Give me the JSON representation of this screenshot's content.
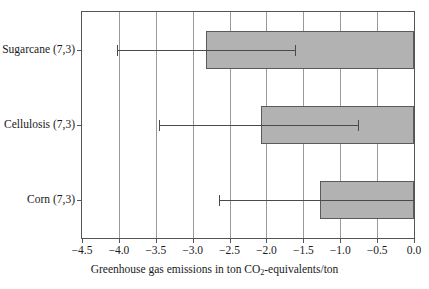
{
  "chart_data": {
    "type": "bar",
    "orientation": "horizontal",
    "title": "",
    "xlabel": "Greenhouse gas emissions in ton CO2-equivalents/ton",
    "xlabel_parts": {
      "before": "Greenhouse gas emissions in ton CO",
      "sub": "2",
      "after": "-equivalents/ton"
    },
    "ylabel": "",
    "categories": [
      "Sugarcane (7,3)",
      "Cellulosis (7,3)",
      "Corn (7,3)"
    ],
    "values": [
      -2.82,
      -2.08,
      -1.27
    ],
    "error_low": [
      -4.02,
      -3.45,
      -2.64
    ],
    "error_high": [
      -1.61,
      -0.76,
      0.0
    ],
    "xlim": [
      -4.5,
      0.0
    ],
    "xticks": [
      -4.5,
      -4.0,
      -3.5,
      -3.0,
      -2.5,
      -2.0,
      -1.5,
      -1.0,
      -0.5,
      0.0
    ],
    "xticklabels": [
      "−4.5",
      "−4.0",
      "−3.5",
      "−3.0",
      "−2.5",
      "−2.0",
      "−1.5",
      "−1.0",
      "−0.5",
      "0.0"
    ],
    "grid": "vertical",
    "legend": "none",
    "bar_color": "#b2b2b2",
    "bar_edge_color": "#5a5a5a",
    "error_color": "#4a4a4a",
    "grid_color": "#9a9a9a",
    "frame_color": "#555555",
    "series": [
      {
        "name": "Sugarcane (7,3)",
        "value": -2.82,
        "error_low": -4.02,
        "error_high": -1.61
      },
      {
        "name": "Cellulosis (7,3)",
        "value": -2.08,
        "error_low": -3.45,
        "error_high": -0.76
      },
      {
        "name": "Corn (7,3)",
        "value": -1.27,
        "error_low": -2.64,
        "error_high": 0.0
      }
    ]
  }
}
